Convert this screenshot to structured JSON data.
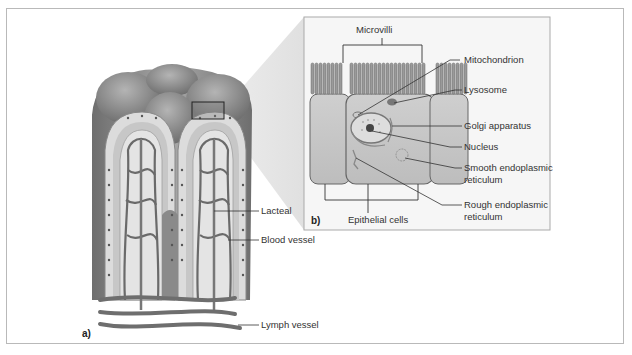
{
  "figure": {
    "panel_a": {
      "letter": "a)",
      "labels": {
        "lacteal": "Lacteal",
        "blood_vessel": "Blood vessel",
        "lymph_vessel": "Lymph vessel"
      }
    },
    "panel_b": {
      "letter": "b)",
      "labels": {
        "microvilli": "Microvilli",
        "mitochondrion": "Mitochondrion",
        "lysosome": "Lysosome",
        "golgi": "Golgi apparatus",
        "nucleus": "Nucleus",
        "smooth_er_1": "Smooth endoplasmic",
        "smooth_er_2": "reticulum",
        "rough_er_1": "Rough endoplasmic",
        "rough_er_2": "reticulum",
        "epithelial": "Epithelial cells"
      }
    }
  },
  "colors": {
    "frame": "#b9b9b9",
    "villus_dark": "#7a7a7a",
    "villus_mid": "#9a9a9a",
    "villus_light": "#c4c4c4",
    "cell_fill": "#d6d6d6",
    "inset_bg": "#f4f4f4",
    "leader": "#333333"
  }
}
